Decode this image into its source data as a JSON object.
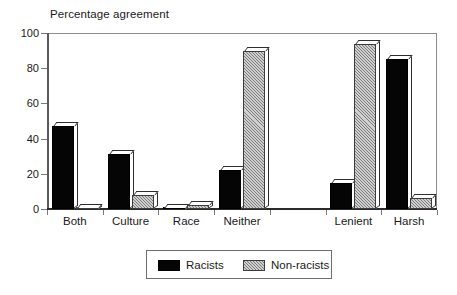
{
  "chart_data": {
    "type": "bar",
    "title": "Percentage agreement",
    "xlabel": "",
    "ylabel": "",
    "ylim": [
      0,
      100
    ],
    "yticks": [
      0,
      20,
      40,
      60,
      80,
      100
    ],
    "grid": false,
    "legend_position": "bottom-center",
    "categories": [
      "Both",
      "Culture",
      "Race",
      "Neither",
      "Lenient",
      "Harsh"
    ],
    "series": [
      {
        "name": "Racists",
        "color": "#050505",
        "pattern": "solid",
        "values": [
          47,
          31,
          0,
          22,
          15,
          85
        ]
      },
      {
        "name": "Non-racists",
        "color": "#cfcfcf",
        "pattern": "hatched",
        "values": [
          0,
          8,
          2,
          90,
          94,
          6
        ]
      }
    ],
    "group_gap_after_index": 3
  },
  "axis": {
    "y_tick_labels": [
      "100",
      "80",
      "60",
      "40",
      "20",
      "0"
    ]
  },
  "legend": {
    "items": [
      {
        "label": "Racists",
        "swatch": "black"
      },
      {
        "label": "Non-racists",
        "swatch": "hatch"
      }
    ]
  }
}
